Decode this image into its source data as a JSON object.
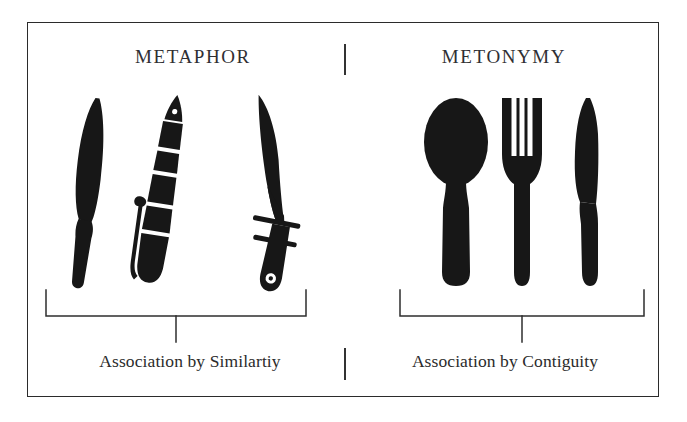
{
  "figure": {
    "title_left": "METAPHOR",
    "title_right": "METONYMY",
    "caption_left": "Association by Similartiy",
    "caption_right": "Association by Contiguity",
    "background_color": "#ffffff",
    "ink_color": "#171717",
    "border_color": "#2b2b2b",
    "text_color": "#2f2f33"
  },
  "left_panel": {
    "heading": "METAPHOR",
    "caption": "Association by Similartiy",
    "icons": [
      {
        "name": "chef-knife-icon",
        "label": "chef's knife"
      },
      {
        "name": "fountain-pen-icon",
        "label": "fountain pen"
      },
      {
        "name": "bowie-knife-icon",
        "label": "bowie knife"
      }
    ]
  },
  "right_panel": {
    "heading": "METONYMY",
    "caption": "Association by Contiguity",
    "icons": [
      {
        "name": "spoon-icon",
        "label": "spoon"
      },
      {
        "name": "fork-icon",
        "label": "fork"
      },
      {
        "name": "table-knife-icon",
        "label": "table knife"
      }
    ]
  },
  "dividers": {
    "top": "vertical-divider-top",
    "bottom": "vertical-divider-bottom"
  },
  "brackets": {
    "left": "grouping-bracket-left",
    "right": "grouping-bracket-right"
  }
}
